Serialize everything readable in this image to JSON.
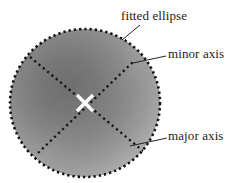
{
  "figure": {
    "title": "",
    "type": "annotated-ellipse-fit-diagram",
    "background_color": "#ffffff",
    "blob": {
      "name": "gray-gradient-blob",
      "center": {
        "x": 85,
        "y": 103
      },
      "radius_x": 75,
      "radius_y": 74,
      "fill_description": "radial gray gradient, darker toward upper-left interior, lighter toward lower-right rim",
      "colors": {
        "dark": "#6f6f6f",
        "mid": "#8d8d8d",
        "light": "#b9b9b9",
        "rim": "#cfcfcf"
      }
    },
    "fitted_ellipse": {
      "name": "fitted-ellipse-outline",
      "style": "dotted",
      "dot_color": "#171717",
      "dot_size": 2.2,
      "dot_count": 150,
      "center": {
        "x": 85,
        "y": 103
      },
      "radius_x": 75,
      "radius_y": 74,
      "rotation_deg": 0
    },
    "axes": [
      {
        "name": "major-axis-line",
        "style": "dotted",
        "dot_color": "#171717",
        "from": {
          "x": 30,
          "y": 57
        },
        "to": {
          "x": 143,
          "y": 151
        },
        "angle_deg": 39.8
      },
      {
        "name": "minor-axis-line",
        "style": "dotted",
        "dot_color": "#171717",
        "from": {
          "x": 38,
          "y": 153
        },
        "to": {
          "x": 134,
          "y": 61
        },
        "angle_deg": -43.8
      }
    ],
    "center_marker": {
      "name": "center-cross-marker",
      "shape": "x",
      "color": "#ffffff",
      "center": {
        "x": 85,
        "y": 103
      },
      "size": 17,
      "stroke_width": 3.2
    },
    "leader_lines": [
      {
        "name": "leader-line-fitted-ellipse",
        "from": {
          "x": 122,
          "y": 40
        },
        "to": {
          "x": 140,
          "y": 25
        },
        "color": "#2a2a2a"
      },
      {
        "name": "leader-line-minor-axis",
        "from": {
          "x": 133,
          "y": 63
        },
        "to": {
          "x": 165,
          "y": 56
        },
        "color": "#2a2a2a"
      },
      {
        "name": "leader-line-major-axis",
        "from": {
          "x": 130,
          "y": 146
        },
        "to": {
          "x": 167,
          "y": 138
        },
        "color": "#2a2a2a"
      }
    ],
    "labels": {
      "fitted_ellipse": "fitted ellipse",
      "minor_axis": "minor axis",
      "major_axis": "major axis"
    }
  }
}
